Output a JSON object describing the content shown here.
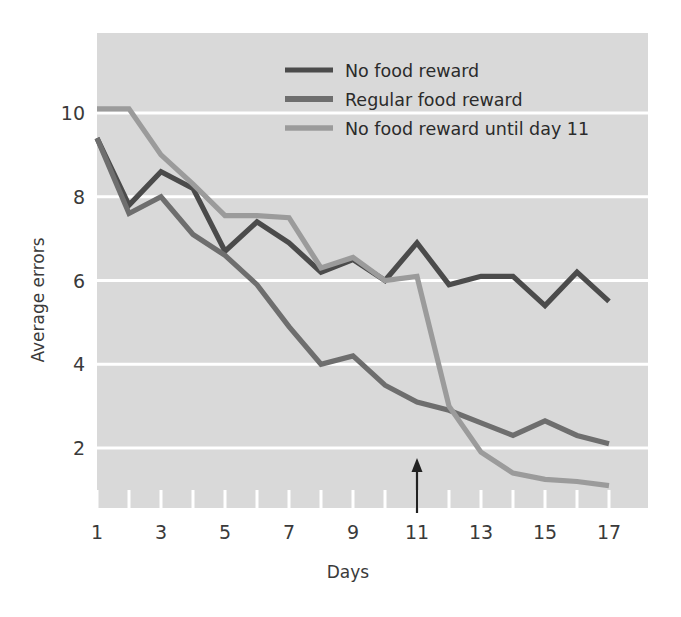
{
  "chart_data": {
    "type": "line",
    "title": "",
    "xlabel": "Days",
    "ylabel": "Average errors",
    "xlim": [
      1,
      17
    ],
    "ylim": [
      0,
      11
    ],
    "grid": true,
    "grid_axis": "y",
    "legend_position": "top-center-right",
    "x": [
      1,
      2,
      3,
      4,
      5,
      6,
      7,
      8,
      9,
      10,
      11,
      12,
      13,
      14,
      15,
      16,
      17
    ],
    "x_tick_labels": [
      "1",
      "3",
      "5",
      "7",
      "9",
      "11",
      "13",
      "15",
      "17"
    ],
    "x_tick_values": [
      1,
      3,
      5,
      7,
      9,
      11,
      13,
      15,
      17
    ],
    "y_tick_labels": [
      "2",
      "4",
      "6",
      "8",
      "10"
    ],
    "y_tick_values": [
      2,
      4,
      6,
      8,
      10
    ],
    "annotation": {
      "type": "arrow",
      "label": "",
      "at_x": 11,
      "at_y": 1.0,
      "direction": "up"
    },
    "series": [
      {
        "name": "No food reward",
        "color": "#4b4b4b",
        "values": [
          9.4,
          7.8,
          8.6,
          8.2,
          6.7,
          7.4,
          6.9,
          6.2,
          6.5,
          6.0,
          6.9,
          5.9,
          6.1,
          6.1,
          5.4,
          6.2,
          5.5
        ]
      },
      {
        "name": "Regular food reward",
        "color": "#6e6e6e",
        "values": [
          9.4,
          7.6,
          8.0,
          7.1,
          6.6,
          5.9,
          4.9,
          4.0,
          4.2,
          3.5,
          3.1,
          2.9,
          2.6,
          2.3,
          2.65,
          2.3,
          2.1
        ]
      },
      {
        "name": "No food reward until day 11",
        "color": "#9b9b9b",
        "values": [
          10.1,
          10.1,
          9.0,
          8.3,
          7.55,
          7.55,
          7.5,
          6.3,
          6.55,
          6.0,
          6.1,
          3.0,
          1.9,
          1.4,
          1.25,
          1.2,
          1.1
        ]
      }
    ]
  },
  "legend": {
    "entries": [
      {
        "label": "No food reward"
      },
      {
        "label": "Regular food reward"
      },
      {
        "label": "No food reward until day 11"
      }
    ]
  },
  "axes": {
    "x_title": "Days",
    "y_title": "Average errors"
  },
  "style": {
    "plot_background": "#d9d9d9",
    "gridline_color": "#ffffff",
    "page_background": "#ffffff",
    "text_color": "#3a3a3a",
    "arrow_color": "#222222"
  }
}
